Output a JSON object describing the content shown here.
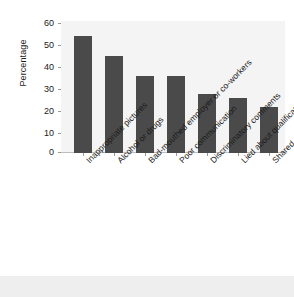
{
  "chart_data": {
    "type": "bar",
    "title": "",
    "xlabel": "",
    "ylabel": "Percentage",
    "ylim": [
      0,
      60
    ],
    "yticks": [
      0,
      10,
      20,
      30,
      40,
      50,
      60
    ],
    "grid": false,
    "legend": "none",
    "orientation": "vertical",
    "bar_color": "#4a4a4a",
    "plot_background": "#f4f4f4",
    "categories": [
      "Inappropriate pictures",
      "Alcohol or drugs",
      "Bad-mouthed employer or co-workers",
      "Poor communication",
      "Discriminatory comments",
      "Lied about qualifications",
      "Shared confidential information"
    ],
    "values": [
      53,
      44,
      35,
      35,
      27,
      25,
      21
    ]
  }
}
